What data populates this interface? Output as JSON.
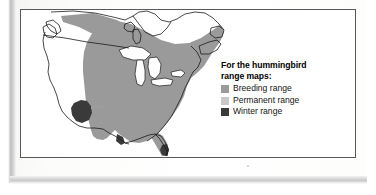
{
  "figure": {
    "type": "range-map",
    "subject": "hummingbird"
  },
  "legend": {
    "title": "For the hummingbird\nrange maps:",
    "title_line1": "For the hummingbird",
    "title_line2": "range maps:",
    "items": [
      {
        "label": "Breeding range",
        "color": "#9a9a9a"
      },
      {
        "label": "Permanent range",
        "color": "#c9c9c9"
      },
      {
        "label": "Winter range",
        "color": "#3a3a3a"
      }
    ]
  },
  "map": {
    "region": "North America",
    "outline_color": "#1a1a1a",
    "land_fill": "#ffffff",
    "water_fill": "#ffffff",
    "ranges": [
      {
        "name": "Breeding range",
        "color": "#9a9a9a",
        "areas": [
          "eastern United States",
          "southern Canada",
          "northwest Canada corridor"
        ]
      },
      {
        "name": "Permanent range",
        "color": "#c9c9c9",
        "areas": []
      },
      {
        "name": "Winter range",
        "color": "#3a3a3a",
        "areas": [
          "southwestern United States",
          "south Texas",
          "south Florida"
        ]
      }
    ]
  }
}
